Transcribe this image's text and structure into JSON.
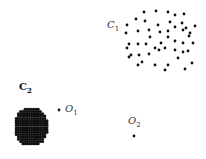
{
  "diagram": {
    "title": "",
    "clusters": [
      {
        "name": "C",
        "subscript": "1",
        "label_pos": [
          107,
          26
        ],
        "density": "sparse",
        "points": [
          [
            144,
            12
          ],
          [
            156,
            11
          ],
          [
            168,
            12
          ],
          [
            175,
            15
          ],
          [
            184,
            14
          ],
          [
            136,
            19
          ],
          [
            145,
            21
          ],
          [
            170,
            22
          ],
          [
            182,
            23
          ],
          [
            127,
            25
          ],
          [
            158,
            25
          ],
          [
            175,
            27
          ],
          [
            186,
            28
          ],
          [
            195,
            26
          ],
          [
            126,
            33
          ],
          [
            138,
            31
          ],
          [
            149,
            30
          ],
          [
            160,
            32
          ],
          [
            168,
            31
          ],
          [
            183,
            30
          ],
          [
            190,
            33
          ],
          [
            129,
            44
          ],
          [
            138,
            44
          ],
          [
            146,
            44
          ],
          [
            161,
            43
          ],
          [
            175,
            41
          ],
          [
            183,
            43
          ],
          [
            193,
            43
          ],
          [
            150,
            37
          ],
          [
            168,
            37
          ],
          [
            189,
            36
          ],
          [
            129,
            57
          ],
          [
            139,
            55
          ],
          [
            149,
            54
          ],
          [
            155,
            48
          ],
          [
            165,
            48
          ],
          [
            175,
            50
          ],
          [
            183,
            52
          ],
          [
            188,
            51
          ],
          [
            159,
            50
          ],
          [
            127,
            48
          ],
          [
            138,
            65
          ],
          [
            142,
            62
          ],
          [
            155,
            65
          ],
          [
            168,
            65
          ],
          [
            178,
            58
          ],
          [
            192,
            63
          ],
          [
            185,
            69
          ],
          [
            165,
            70
          ],
          [
            131,
            55
          ]
        ]
      },
      {
        "name": "C",
        "subscript": "2",
        "label_pos": [
          19,
          88
        ],
        "density": "dense",
        "center": [
          31,
          127
        ],
        "radius": 17
      }
    ],
    "outliers": [
      {
        "name": "O",
        "subscript": "1",
        "point": [
          59,
          110
        ],
        "label_pos": [
          65,
          110
        ]
      },
      {
        "name": "O",
        "subscript": "2",
        "point": [
          134,
          136
        ],
        "label_pos": [
          128,
          122
        ]
      }
    ],
    "colors": {
      "point": "#111111",
      "label": "#333333",
      "background": "#ffffff"
    }
  }
}
